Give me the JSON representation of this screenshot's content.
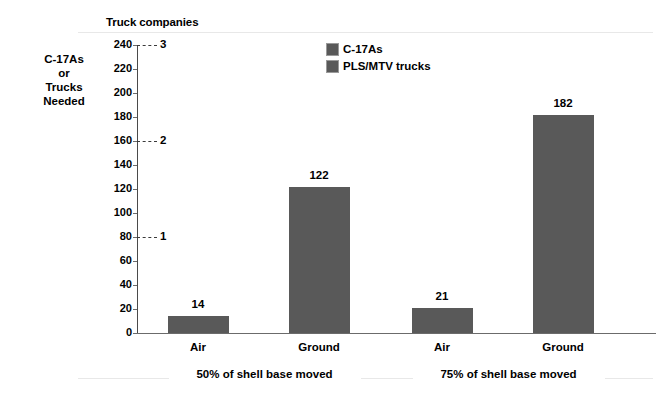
{
  "chart_data": {
    "type": "bar",
    "title": "",
    "secondary_axis_title": "Truck companies",
    "ylabel_lines": [
      "C-17As",
      "or",
      "Trucks",
      "Needed"
    ],
    "ylabel": "C-17As or Trucks Needed",
    "xlabel": "",
    "categories": [
      "Air",
      "Ground",
      "Air",
      "Ground"
    ],
    "values": [
      14,
      122,
      21,
      182
    ],
    "value_labels": [
      "14",
      "122",
      "21",
      "182"
    ],
    "groups": [
      {
        "label": "50% of shell base moved",
        "categories": [
          "Air",
          "Ground"
        ],
        "values": [
          14,
          122
        ]
      },
      {
        "label": "75% of shell base moved",
        "categories": [
          "Air",
          "Ground"
        ],
        "values": [
          21,
          182
        ]
      }
    ],
    "ylim": [
      0,
      240
    ],
    "yticks": [
      0,
      20,
      40,
      60,
      80,
      100,
      120,
      140,
      160,
      180,
      200,
      220,
      240
    ],
    "ytick_labels": [
      "0",
      "20",
      "40",
      "60",
      "80",
      "100",
      "120",
      "140",
      "160",
      "180",
      "200",
      "220",
      "240"
    ],
    "secondary_ylim": [
      0,
      3
    ],
    "secondary_yticks": [
      1,
      2,
      3
    ],
    "secondary_ytick_labels": [
      "1",
      "2",
      "3"
    ],
    "secondary_tick_primary_positions": [
      80,
      160,
      240
    ],
    "grid": false,
    "legend_position": "top-center",
    "legend": [
      {
        "label": "C-17As",
        "color": "#595959"
      },
      {
        "label": "PLS/MTV trucks",
        "color": "#595959"
      }
    ],
    "bar_color": "#595959",
    "background_color": "#ffffff",
    "axis_color": "#4a4a4a"
  }
}
